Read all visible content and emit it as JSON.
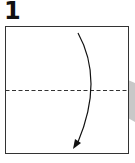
{
  "step": {
    "number": "1"
  },
  "diagram": {
    "type": "origami-fold-step",
    "instruction": "valley fold top edge down to bottom edge",
    "paper": {
      "shape": "square",
      "fill": "#ffffff",
      "stroke": "#333333"
    },
    "fold_line": {
      "style": "dashed",
      "orientation": "horizontal",
      "position": "middle",
      "color": "#333333"
    },
    "arrow": {
      "direction": "down",
      "style": "curved",
      "color": "#111111"
    },
    "shadow": {
      "side": "right",
      "color": "#c8c8c8"
    }
  }
}
